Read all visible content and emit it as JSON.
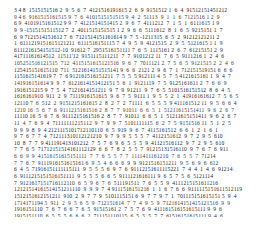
{
  "page": {
    "background_color": "#ffffff",
    "ink_color": "#2b2b2b",
    "width": 274,
    "height": 227
  },
  "text_block": {
    "left": 14,
    "top": 7,
    "columns_approx": 72,
    "rows_count": 31,
    "font_size_px": 5.6,
    "line_height_px": 6.65,
    "rows": [
      "3 4 8  1515151516 2  9  5  6  7  4121516191615 2  6  9  9151512 1  6  4  91512151451212",
      "9 4 6  9161515161515 9  7  6  4101515151515 9  4  2  51113  9  1  1  6  7121516 1 2  9",
      "6 9  4101915161512 9 9  7  4121514151415 2  9  6  7  4111212  7  1  5  1  6111615 1 9",
      "9  9 -1515151511512 7  2  4011515151515 1 2  9  6  6  5111612  8  1  6  5  9215151 1  7",
      "6  9 7121514151612 7  6  7121514151161614 9  7  5 -1211315  6  5  2  91212121211 2",
      "1  6111219151615121211  6111516151115 7  4  9  5  9  4121515  2  9  5  5121615 1 1  9",
      "6111216154151512-10  91612 7  2951516151111 7  6  5  1115161 2  6  7  61215151 2  9",
      "41711161614512  11511'12  9151115111211  7  7  9101212 11  7  6  5  9111216 1  2  4  6",
      "105251516121515  712  4115151615121516  9  6  7  7011121 2  7  5  6  5  9121515 2  2  4  6",
      "125415151615110  711  5121614151515141 9  6  6  2121 2  9  6  7  1  712151519151 6  6  6",
      "1151615141619 7  7  6 912161516151211  7  5  5  5 912111 4  5  7  5 4121615161 1  9  4  7",
      "141916151614 9  9  7  6121614151412151 5  6  1  9121119  7  5  9125161611 2  7  6  6  9",
      "1916151215 9  7  5  4  7121614151211  9  7  9  91211  9  7  6  5  5101516151512  8  6  4  5",
      "1616161910  911  2  9  7111916151615  9  6  7  5  9111 1  9  5  5  2  1  41916161612  7  5  6  5",
      "12110 7  6  512  2  9151215161615 2  8  2  7  2  71111  6  5  5  5  9 411161512 11  9  5  6  6  4",
      "1210 16  5  6  7  6  9111215161516 2  8  7  7  91011  6  6  5  1  51211615151411  9  6  2  6  7",
      "11110 16  5  6  7  6  9111215161516 2  8  7  7  91011  6  6  5  1  51211615151411  9  6  2  6  7",
      "11  4  7  6  9  4  71111111215112  9  7  9  9  7  5101111115  6  2  7  5  9151516 11  5  1  2  5",
      "9  9  9  8  9  4 2121115101712110110  6  5  919  9  6  7  4115161512  6  6  1  2  1  6  1",
      "9  7  6  7  7  4  712111310112121210  9  7  9  9  5  5  5  7  4112151612  9  7  2  9  5  610",
      "10  8  7  7  9 411191413101212  7  5  7  6  9  6  5  5  5  9  41121516112  9  7  2  9  5  610",
      "7  7  6  5  71712151514161112129  6  6  7  8  2  5  5  7  91215131516110  9  7  6  7  6  911",
      "6  6  9  9  41516151615151111  7  7  6  5  5  7  7  1111411161210  7  6  5  5  7  71214",
      "7  7  6  7  9111916151615161 6  9  5  4  6  6  6  9  9  9121516151211  9  5  6  9  6  612",
      "6  4  5  71916151111115111  9  5  5  5  6  9  7  6  91112151611115221  7  4  4  1  4  6  91214",
      "6  9111215151516151111  9  5  5  5  6  6  5  9111121616111 9  6  5  7  5  6  5121114",
      "7  9121617151716112110  6  5  9  6  7  6  511191511  7  6  5  5  9  4111215151611216",
      "12121514161514151211110  9  9  9  7  4 9111516151216  1  1  6  7  6  6  9111115151611512119",
      "1512151612151211  910  2  9  7  7  9  5101115151 6  9  7  7  9  7  1  701115151615151 5  9  4",
      "1714171194 5  911  2  9  5  6  5  9  712151614  7  7  4  9  5  9  7121614151415121516  9  9",
      "1916151110  7  6  7  6  6  7  6  5  91515161 2  7  5  7  6  9  411161516151615111 9  9  6",
      "1915151110  6  5  5  5  6  6  6  2  711151110115  6  5  5  5  7  7  61516151615111 9  4  6",
      "11619911  6  5  5  9  2  6  4  6  1111111'1/21110  1  7  1  1  7 9101716101612  9  4  4  5  5"
    ]
  }
}
